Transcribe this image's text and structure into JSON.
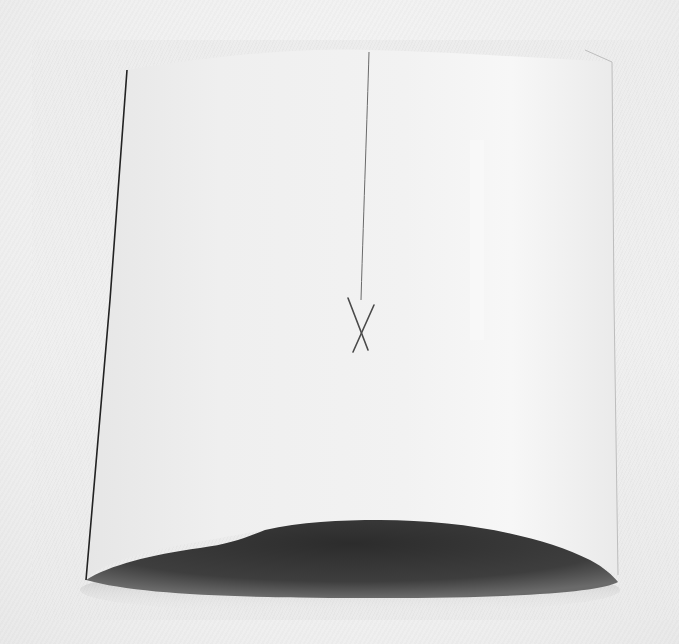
{
  "image": {
    "subject": "curved white sheet with pencil line and X mark",
    "colors": {
      "background": "#eeeeee",
      "sheet_light": "#f2f2f2",
      "sheet_shade": "#e4e4e4",
      "shadow": "#3a3a3a",
      "pencil": "#555555",
      "edge_line": "#222222"
    }
  }
}
